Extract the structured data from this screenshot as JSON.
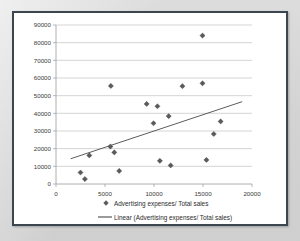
{
  "chart_data": {
    "type": "scatter",
    "title": "",
    "xlabel": "",
    "ylabel": "",
    "xlim": [
      0,
      20000
    ],
    "ylim": [
      0,
      90000
    ],
    "xticks": [
      "0",
      "5000",
      "10000",
      "15000",
      "20000"
    ],
    "yticks": [
      "0",
      "10000",
      "20000",
      "30000",
      "40000",
      "50000",
      "60000",
      "70000",
      "80000",
      "90000"
    ],
    "xtick_values": [
      0,
      5000,
      10000,
      15000,
      20000
    ],
    "ytick_values": [
      0,
      10000,
      20000,
      30000,
      40000,
      50000,
      60000,
      70000,
      80000,
      90000
    ],
    "grid": "horizontal",
    "legend_position": "bottom",
    "series": [
      {
        "name": "Advertising expenses/ Total sales",
        "type": "scatter",
        "marker": "diamond",
        "color": "#5a5a5a",
        "points": [
          [
            2500,
            6500
          ],
          [
            2950,
            2800
          ],
          [
            3400,
            16200
          ],
          [
            5600,
            55500
          ],
          [
            5550,
            21200
          ],
          [
            5950,
            17900
          ],
          [
            6450,
            7400
          ],
          [
            9250,
            45300
          ],
          [
            9950,
            34400
          ],
          [
            10350,
            44000
          ],
          [
            10600,
            13100
          ],
          [
            11500,
            38400
          ],
          [
            11700,
            10500
          ],
          [
            12900,
            55400
          ],
          [
            14950,
            84000
          ],
          [
            14950,
            57000
          ],
          [
            15350,
            13600
          ],
          [
            16100,
            28300
          ],
          [
            16800,
            35400
          ]
        ]
      },
      {
        "name": "Linear (Advertising expenses/ Total sales)",
        "type": "line",
        "color": "#4a4a4a",
        "endpoints": [
          [
            1500,
            14300
          ],
          [
            19000,
            46600
          ]
        ]
      }
    ],
    "legend": [
      {
        "label": "Advertising expenses/ Total sales",
        "symbol": "diamond"
      },
      {
        "label": "Linear (Advertising expenses/ Total sales)",
        "symbol": "line"
      }
    ],
    "colors": {
      "marker": "#5a5a5a",
      "trendline": "#4a4a4a",
      "gridline": "#b8b8b8",
      "axis": "#9a9a9a",
      "frame": "#3c4650",
      "plot_background": "#ffffff",
      "page_background": "#d9d9d9"
    }
  }
}
